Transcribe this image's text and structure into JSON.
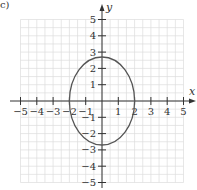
{
  "panel_label": "c)",
  "chart_data": {
    "type": "line",
    "title": "",
    "xlabel": "x",
    "ylabel": "y",
    "xlim": [
      -5,
      5
    ],
    "ylim": [
      -5,
      5
    ],
    "grid": true,
    "x_ticks": [
      -5,
      -4,
      -3,
      -2,
      -1,
      1,
      2,
      3,
      4,
      5
    ],
    "y_ticks": [
      5,
      4,
      3,
      2,
      1,
      -1,
      -2,
      -3,
      -4,
      -5
    ],
    "x_tick_labels": [
      "−5",
      "−4",
      "−3",
      "−2",
      "−1",
      "1",
      "2",
      "3",
      "4",
      "5"
    ],
    "y_tick_labels": [
      "5",
      "4",
      "3",
      "2",
      "1",
      "−1",
      "−2",
      "−3",
      "−4",
      "−5"
    ],
    "series": [
      {
        "name": "ellipse",
        "shape": "ellipse",
        "center": [
          0,
          0
        ],
        "x_radius": 2,
        "y_radius": 2.7,
        "color": "#555555"
      }
    ],
    "colors": {
      "grid": "#dddddd",
      "axis": "#333333",
      "curve": "#555555"
    }
  }
}
